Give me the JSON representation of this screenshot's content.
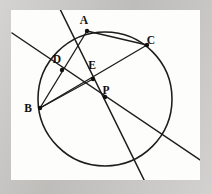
{
  "figure": {
    "kind": "euclidean-geometry-diagram",
    "background_color": "#c9c7c4",
    "canvas_color": "#fdfdfc",
    "ink_color": "#1d1d1d",
    "canvas": {
      "x": 11,
      "y": 10,
      "width": 189,
      "height": 170
    },
    "circle": {
      "cx": 105,
      "cy": 99,
      "r": 67
    },
    "points": [
      {
        "id": "A",
        "label": "A",
        "x": 87,
        "y": 31,
        "label_x": 84,
        "label_y": 24
      },
      {
        "id": "C",
        "label": "C",
        "x": 147,
        "y": 45,
        "label_x": 151,
        "label_y": 44
      },
      {
        "id": "D",
        "label": "D",
        "x": 62,
        "y": 70,
        "label_x": 57,
        "label_y": 63
      },
      {
        "id": "E",
        "label": "E",
        "x": 93,
        "y": 79,
        "label_x": 92,
        "label_y": 69
      },
      {
        "id": "B",
        "label": "B",
        "x": 40,
        "y": 108,
        "label_x": 28,
        "label_y": 112
      },
      {
        "id": "P",
        "label": "P",
        "x": 105,
        "y": 97,
        "label_x": 106,
        "label_y": 94
      }
    ],
    "segments": [
      {
        "name": "line-through-D-P",
        "from": [
          12,
          33
        ],
        "to": [
          200,
          160
        ]
      },
      {
        "name": "line-through-A-E-P",
        "from": [
          58,
          5
        ],
        "to": [
          149,
          190
        ]
      },
      {
        "name": "chord-A-C",
        "from": [
          87,
          31
        ],
        "to": [
          147,
          45
        ]
      },
      {
        "name": "chord-B-C",
        "from": [
          40,
          108
        ],
        "to": [
          147,
          45
        ]
      },
      {
        "name": "chord-A-B",
        "from": [
          87,
          31
        ],
        "to": [
          40,
          108
        ]
      },
      {
        "name": "segment-B-E",
        "from": [
          40,
          108
        ],
        "to": [
          93,
          79
        ]
      }
    ],
    "labels_text": [
      "A",
      "B",
      "C",
      "D",
      "E",
      "P"
    ]
  }
}
